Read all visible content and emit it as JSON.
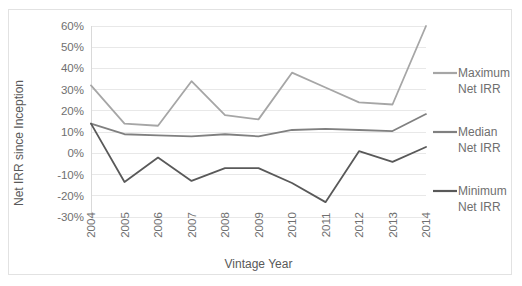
{
  "chart_data": {
    "type": "line",
    "title": "",
    "xlabel": "Vintage Year",
    "ylabel": "Net IRR since Inception",
    "x": [
      "2004",
      "2005",
      "2006",
      "2007",
      "2008",
      "2009",
      "2010",
      "2011",
      "2012",
      "2013",
      "2014"
    ],
    "categories": [
      "2004",
      "2005",
      "2006",
      "2007",
      "2008",
      "2009",
      "2010",
      "2011",
      "2012",
      "2013",
      "2014"
    ],
    "ylim": [
      -30,
      60
    ],
    "ytick_labels": [
      "60%",
      "50%",
      "40%",
      "30%",
      "20%",
      "10%",
      "0%",
      "-10%",
      "-20%",
      "-30%"
    ],
    "ytick_values": [
      60,
      50,
      40,
      30,
      20,
      10,
      0,
      -10,
      -20,
      -30
    ],
    "grid": true,
    "legend_position": "right",
    "series": [
      {
        "name": "Maximum Net IRR",
        "legend_line1": "Maximum",
        "legend_line2": "Net IRR",
        "color": "#a6a6a6",
        "values": [
          32,
          14,
          13,
          34,
          18,
          16,
          38,
          31,
          24,
          23,
          60
        ]
      },
      {
        "name": "Median Net IRR",
        "legend_line1": "Median",
        "legend_line2": "Net IRR",
        "color": "#808080",
        "values": [
          14,
          9,
          8.5,
          8,
          9,
          8,
          11,
          11.5,
          11,
          10.5,
          18.5
        ]
      },
      {
        "name": "Minimum Net IRR",
        "legend_line1": "Minimum",
        "legend_line2": "Net IRR",
        "color": "#595959",
        "values": [
          14,
          -13.5,
          -2,
          -13,
          -7,
          -7,
          -14,
          -23,
          1,
          -4,
          3
        ]
      }
    ]
  },
  "colors": {
    "gridline": "#e8e8e8",
    "frame_border": "#e2e2e2",
    "tick_text": "#6f6f6f",
    "axis_title": "#595959",
    "maximum": "#a6a6a6",
    "median": "#808080",
    "minimum": "#595959"
  }
}
